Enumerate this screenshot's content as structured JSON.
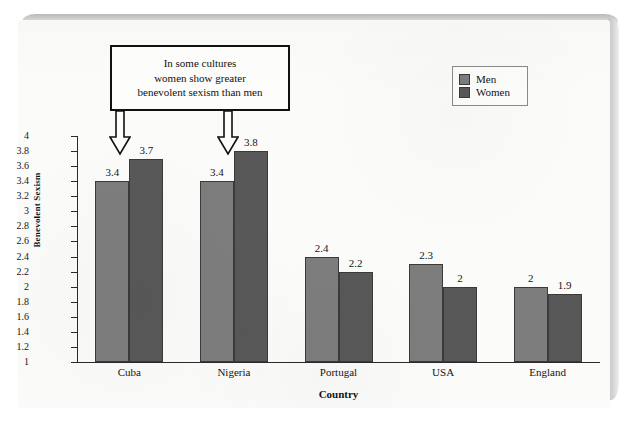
{
  "chart_data": {
    "type": "bar",
    "title": "",
    "xlabel": "Country",
    "ylabel": "Benevolent Sexism",
    "categories": [
      "Cuba",
      "Nigeria",
      "Portugal",
      "USA",
      "England"
    ],
    "series": [
      {
        "name": "Men",
        "color": "#7d7d7d",
        "values": [
          3.4,
          3.4,
          2.4,
          2.3,
          2.0
        ],
        "labels": [
          "3.4",
          "3.4",
          "2.4",
          "2.3",
          "2"
        ]
      },
      {
        "name": "Women",
        "color": "#585858",
        "values": [
          3.7,
          3.8,
          2.2,
          2.0,
          1.9
        ],
        "labels": [
          "3.7",
          "3.8",
          "2.2",
          "2",
          "1.9"
        ]
      }
    ],
    "ylim": [
      1,
      4
    ],
    "ytick_step": 0.2,
    "ytick_labels": [
      "4",
      "3.8",
      "3.6",
      "3.4",
      "3.2",
      "3",
      "2.8",
      "2.6",
      "2.4",
      "2.2",
      "2",
      "1.8",
      "1.6",
      "1.4",
      "1.2",
      "1"
    ],
    "grid": false,
    "legend_position": "top-right"
  },
  "legend": {
    "items": [
      {
        "label": "Men",
        "color": "#7d7d7d"
      },
      {
        "label": "Women",
        "color": "#585858"
      }
    ]
  },
  "annotation": {
    "text": "In some cultures women show greater benevolent sexism than men",
    "lines": [
      "In some cultures",
      "women show greater",
      "benevolent sexism than men"
    ],
    "points_to": [
      "Cuba-Women",
      "Nigeria-Women"
    ]
  },
  "axes": {
    "y_title": "Benevolent Sexism",
    "x_title": "Country"
  }
}
